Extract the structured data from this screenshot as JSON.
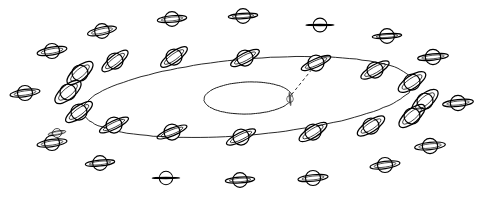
{
  "figure": {
    "title": "",
    "caption": "",
    "background_color": "#ffffff",
    "ink_color": "#000000",
    "width": 486,
    "height": 200
  },
  "chart_data": {
    "type": "scatter",
    "title": "",
    "subtitle": "",
    "xlabel": "",
    "ylabel": "",
    "grid": false,
    "legend_position": "none",
    "axis_ranges": {
      "x": [
        0,
        486
      ],
      "y": [
        0,
        200
      ]
    },
    "paths": [
      {
        "name": "outer-orbit-ellipse",
        "kind": "ellipse",
        "center": [
          248,
          97
        ],
        "rx": 166,
        "ry": 38,
        "rotation_deg": -5,
        "style": "solid"
      },
      {
        "name": "inner-orbit-ellipse",
        "kind": "ellipse",
        "center": [
          248,
          98
        ],
        "rx": 44,
        "ry": 16,
        "rotation_deg": -2,
        "style": "solid"
      },
      {
        "name": "sight-line",
        "kind": "line",
        "from": [
          288,
          99
        ],
        "to": [
          317,
          63
        ],
        "style": "dashed"
      }
    ],
    "series": [
      {
        "name": "inner-orbit-saturn",
        "count": 1,
        "points": [
          {
            "x": 290,
            "y": 99,
            "scale": 0.42,
            "ring_tilt_deg": 84,
            "ring_open": 0.1,
            "style": "edge-on-small"
          }
        ]
      },
      {
        "name": "outer-orbit-saturn",
        "count": 16,
        "points": [
          {
            "x": 115,
            "y": 61,
            "scale": 1.0,
            "ring_tilt_deg": -38,
            "ring_open": 0.34
          },
          {
            "x": 174,
            "y": 57,
            "scale": 1.0,
            "ring_tilt_deg": -36,
            "ring_open": 0.33
          },
          {
            "x": 245,
            "y": 58,
            "scale": 1.0,
            "ring_tilt_deg": -28,
            "ring_open": 0.3
          },
          {
            "x": 316,
            "y": 63,
            "scale": 1.0,
            "ring_tilt_deg": -24,
            "ring_open": 0.26
          },
          {
            "x": 375,
            "y": 70,
            "scale": 1.0,
            "ring_tilt_deg": -30,
            "ring_open": 0.32
          },
          {
            "x": 412,
            "y": 82,
            "scale": 1.0,
            "ring_tilt_deg": -34,
            "ring_open": 0.4
          },
          {
            "x": 425,
            "y": 101,
            "scale": 1.0,
            "ring_tilt_deg": -40,
            "ring_open": 0.44
          },
          {
            "x": 412,
            "y": 116,
            "scale": 1.0,
            "ring_tilt_deg": -40,
            "ring_open": 0.42
          },
          {
            "x": 371,
            "y": 126,
            "scale": 1.0,
            "ring_tilt_deg": -34,
            "ring_open": 0.36
          },
          {
            "x": 313,
            "y": 132,
            "scale": 1.0,
            "ring_tilt_deg": -32,
            "ring_open": 0.34
          },
          {
            "x": 241,
            "y": 137,
            "scale": 1.0,
            "ring_tilt_deg": -26,
            "ring_open": 0.28
          },
          {
            "x": 172,
            "y": 132,
            "scale": 1.0,
            "ring_tilt_deg": -22,
            "ring_open": 0.24
          },
          {
            "x": 114,
            "y": 125,
            "scale": 1.0,
            "ring_tilt_deg": -26,
            "ring_open": 0.26
          },
          {
            "x": 79,
            "y": 112,
            "scale": 1.0,
            "ring_tilt_deg": -36,
            "ring_open": 0.36
          },
          {
            "x": 68,
            "y": 92,
            "scale": 1.0,
            "ring_tilt_deg": -40,
            "ring_open": 0.44
          },
          {
            "x": 80,
            "y": 73,
            "scale": 1.0,
            "ring_tilt_deg": -40,
            "ring_open": 0.42
          }
        ]
      },
      {
        "name": "outer-field-saturn",
        "count": 18,
        "points": [
          {
            "x": 102,
            "y": 31,
            "scale": 0.92,
            "ring_tilt_deg": -12,
            "ring_open": 0.26
          },
          {
            "x": 172,
            "y": 19,
            "scale": 0.92,
            "ring_tilt_deg": -6,
            "ring_open": 0.22
          },
          {
            "x": 243,
            "y": 16,
            "scale": 0.92,
            "ring_tilt_deg": -4,
            "ring_open": 0.18
          },
          {
            "x": 320,
            "y": 25,
            "scale": 0.86,
            "ring_tilt_deg": 0,
            "ring_open": 0.02
          },
          {
            "x": 387,
            "y": 36,
            "scale": 0.92,
            "ring_tilt_deg": -4,
            "ring_open": 0.16
          },
          {
            "x": 433,
            "y": 57,
            "scale": 0.96,
            "ring_tilt_deg": -6,
            "ring_open": 0.2
          },
          {
            "x": 458,
            "y": 103,
            "scale": 0.96,
            "ring_tilt_deg": -6,
            "ring_open": 0.22
          },
          {
            "x": 430,
            "y": 146,
            "scale": 0.96,
            "ring_tilt_deg": -6,
            "ring_open": 0.24
          },
          {
            "x": 385,
            "y": 165,
            "scale": 0.94,
            "ring_tilt_deg": -8,
            "ring_open": 0.24
          },
          {
            "x": 313,
            "y": 178,
            "scale": 0.94,
            "ring_tilt_deg": -6,
            "ring_open": 0.22
          },
          {
            "x": 240,
            "y": 180,
            "scale": 0.92,
            "ring_tilt_deg": -4,
            "ring_open": 0.2
          },
          {
            "x": 166,
            "y": 178,
            "scale": 0.84,
            "ring_tilt_deg": 0,
            "ring_open": 0.02
          },
          {
            "x": 100,
            "y": 163,
            "scale": 0.92,
            "ring_tilt_deg": -6,
            "ring_open": 0.2
          },
          {
            "x": 52,
            "y": 143,
            "scale": 0.94,
            "ring_tilt_deg": -8,
            "ring_open": 0.24
          },
          {
            "x": 25,
            "y": 93,
            "scale": 0.94,
            "ring_tilt_deg": -8,
            "ring_open": 0.24
          },
          {
            "x": 52,
            "y": 51,
            "scale": 0.94,
            "ring_tilt_deg": -10,
            "ring_open": 0.26
          },
          {
            "x": 57,
            "y": 133,
            "scale": 0.56,
            "ring_tilt_deg": -10,
            "ring_open": 0.22
          },
          {
            "x": 222,
            "y": 82,
            "scale": 0.0,
            "ring_tilt_deg": 0,
            "ring_open": 0.0
          }
        ]
      }
    ],
    "annotations": [
      {
        "text": "",
        "x": 248,
        "y": 98,
        "name": "inner-ellipse-annotation"
      }
    ]
  }
}
